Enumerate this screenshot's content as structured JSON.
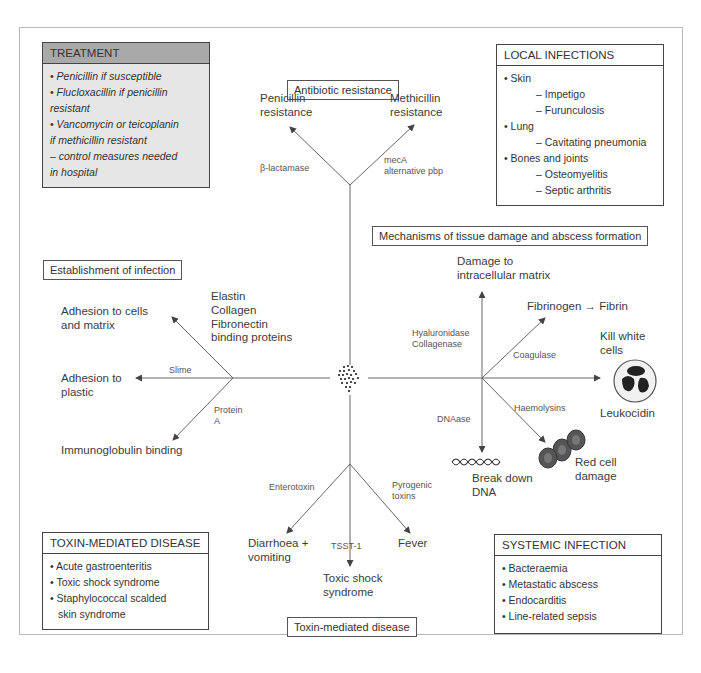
{
  "diagram": {
    "center": "Staphylococcus aureus cluster",
    "sections": {
      "antibiotic_resistance": {
        "title": "Antibiotic resistance",
        "branches": [
          {
            "mechanism": "β-lactamase",
            "outcome_line1": "Penicillin",
            "outcome_line2": "resistance"
          },
          {
            "mechanism_line1": "mecA",
            "mechanism_line2": "alternative pbp",
            "outcome_line1": "Methicillin",
            "outcome_line2": "resistance"
          }
        ]
      },
      "establishment": {
        "title": "Establishment of infection",
        "branches": [
          {
            "mechanism_lines": [
              "Elastin",
              "Collagen",
              "Fibronectin",
              "binding proteins"
            ],
            "outcome_line1": "Adhesion to cells",
            "outcome_line2": "and matrix"
          },
          {
            "mechanism": "Slime",
            "outcome_line1": "Adhesion to",
            "outcome_line2": "plastic"
          },
          {
            "mechanism_line1": "Protein",
            "mechanism_line2": "A",
            "outcome": "Immunoglobulin binding"
          }
        ]
      },
      "tissue_damage": {
        "title": "Mechanisms of tissue damage and abscess formation",
        "branches": [
          {
            "mechanism_line1": "Hyaluronidase",
            "mechanism_line2": "Collagenase",
            "outcome_line1": "Damage to",
            "outcome_line2": "intracellular matrix"
          },
          {
            "mechanism": "Coagulase",
            "outcome": "Fibrinogen → Fibrin"
          },
          {
            "mechanism": "Leukocidin",
            "outcome_line1": "Kill white",
            "outcome_line2": "cells"
          },
          {
            "mechanism": "Haemolysins",
            "outcome_line1": "Red cell",
            "outcome_line2": "damage"
          },
          {
            "mechanism": "DNAase",
            "outcome_line1": "Break down",
            "outcome_line2": "DNA"
          }
        ]
      },
      "toxin": {
        "title": "Toxin-mediated disease",
        "branches": [
          {
            "mechanism": "Enterotoxin",
            "outcome_line1": "Diarrhoea +",
            "outcome_line2": "vomiting"
          },
          {
            "mechanism": "TSST-1",
            "outcome_line1": "Toxic shock",
            "outcome_line2": "syndrome"
          },
          {
            "mechanism_line1": "Pyrogenic",
            "mechanism_line2": "toxins",
            "outcome": "Fever"
          }
        ]
      }
    },
    "panels": {
      "treatment": {
        "title": "TREATMENT",
        "items": [
          "• Penicillin if susceptible",
          "• Flucloxacillin if penicillin",
          "resistant",
          "• Vancomycin or teicoplanin",
          "if methicillin resistant",
          "– control measures needed",
          "in hospital"
        ]
      },
      "local_infections": {
        "title": "LOCAL INFECTIONS",
        "items": [
          {
            "text": "• Skin",
            "sub": false
          },
          {
            "text": "– Impetigo",
            "sub": true
          },
          {
            "text": "– Furunculosis",
            "sub": true
          },
          {
            "text": "• Lung",
            "sub": false
          },
          {
            "text": "– Cavitating pneumonia",
            "sub": true
          },
          {
            "text": "• Bones and joints",
            "sub": false
          },
          {
            "text": "– Osteomyelitis",
            "sub": true
          },
          {
            "text": "– Septic arthritis",
            "sub": true
          }
        ]
      },
      "toxin_mediated": {
        "title": "TOXIN-MEDIATED DISEASE",
        "items": [
          "• Acute gastroenteritis",
          "• Toxic shock syndrome",
          "• Staphylococcal scalded",
          "  skin syndrome"
        ]
      },
      "systemic": {
        "title": "SYSTEMIC INFECTION",
        "items": [
          "• Bacteraemia",
          "• Metastatic abscess",
          "• Endocarditis",
          "• Line-related sepsis"
        ]
      }
    },
    "colors": {
      "line": "#555555",
      "treatment_header": "#a9a9a9",
      "treatment_body": "#e6e6e6",
      "text": "#3a3a3a"
    }
  }
}
